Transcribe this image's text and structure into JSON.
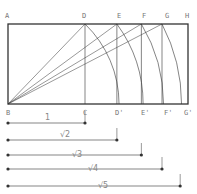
{
  "diagram": {
    "top_labels": [
      "A",
      "D",
      "E",
      "F",
      "G",
      "H"
    ],
    "bottom_labels": [
      "B",
      "C",
      "D'",
      "E'",
      "F'",
      "G'"
    ],
    "dimensions": [
      {
        "label": "1",
        "value": 1
      },
      {
        "label": "√2",
        "value": 1.414
      },
      {
        "label": "√3",
        "value": 1.732
      },
      {
        "label": "√4",
        "value": 2
      },
      {
        "label": "√5",
        "value": 2.236
      }
    ],
    "stroke_color": "#333333",
    "label_color": "#777777"
  }
}
